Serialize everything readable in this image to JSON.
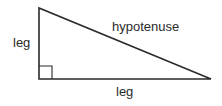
{
  "diagram": {
    "labels": {
      "left_leg": "leg",
      "bottom_leg": "leg",
      "hypotenuse": "hypotenuse"
    },
    "right_angle_marker": true,
    "line_color": "#2a2a2a"
  }
}
